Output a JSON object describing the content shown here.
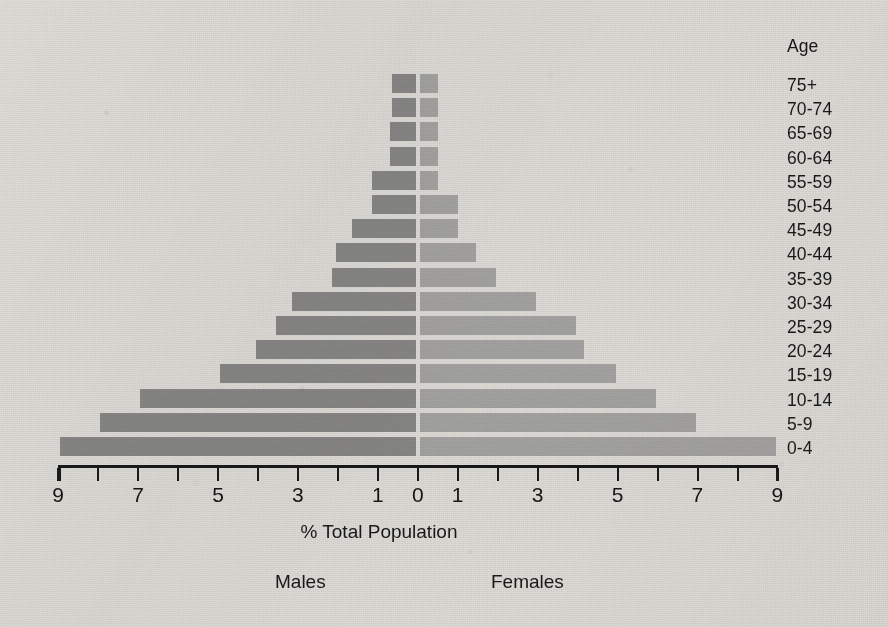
{
  "labels": {
    "age_heading": "Age",
    "x_axis_title": "% Total Population",
    "males": "Males",
    "females": "Females"
  },
  "colors": {
    "male_bar": "#8b8b8b",
    "female_bar": "#aaaaaa",
    "axis": "#141414",
    "background": "#e9e8e5"
  },
  "chart_data": {
    "type": "bar",
    "subtype": "population-pyramid",
    "title": "",
    "xlabel": "% Total Population",
    "ylabel": "Age",
    "categories": [
      "0-4",
      "5-9",
      "10-14",
      "15-19",
      "20-24",
      "25-29",
      "30-34",
      "35-39",
      "40-44",
      "45-49",
      "50-54",
      "55-59",
      "60-64",
      "65-69",
      "70-74",
      "75+"
    ],
    "series": [
      {
        "name": "Males",
        "side": "left",
        "color": "#8b8b8b",
        "values": [
          8.9,
          7.9,
          6.9,
          4.9,
          4.0,
          3.5,
          3.1,
          2.1,
          2.0,
          1.6,
          1.1,
          1.1,
          0.65,
          0.65,
          0.6,
          0.6
        ]
      },
      {
        "name": "Females",
        "side": "right",
        "color": "#aaaaaa",
        "values": [
          8.9,
          6.9,
          5.9,
          4.9,
          4.1,
          3.9,
          2.9,
          1.9,
          1.4,
          0.95,
          0.95,
          0.45,
          0.45,
          0.45,
          0.45,
          0.45
        ]
      }
    ],
    "x_ticks": [
      9,
      8,
      7,
      6,
      5,
      4,
      3,
      2,
      1,
      0,
      1,
      2,
      3,
      4,
      5,
      6,
      7,
      8,
      9
    ],
    "x_tick_labels": [
      "9",
      "",
      "7",
      "",
      "5",
      "",
      "3",
      "",
      "1",
      "0",
      "1",
      "",
      "3",
      "",
      "5",
      "",
      "7",
      "",
      "9"
    ],
    "xlim": [
      -9,
      9
    ],
    "grid": false,
    "legend": [
      "Males",
      "Females"
    ],
    "legend_position": "below-axis"
  },
  "geometry": {
    "center_x": 418,
    "px_per_unit": 39.95,
    "axis_y": 465,
    "bar_height": 19,
    "row_pitch": 24.2,
    "first_row_top": 74
  }
}
